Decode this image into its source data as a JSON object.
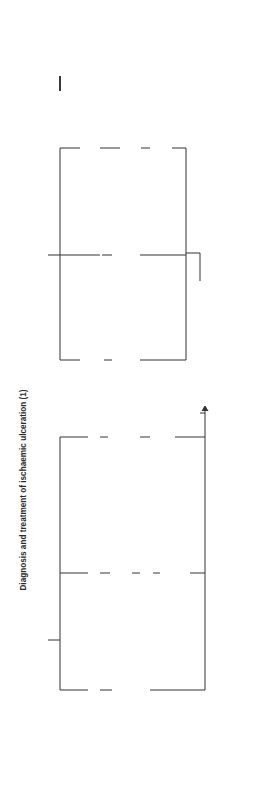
{
  "title": "Diagnosis and treatment of ischaemic ulceration (1)",
  "sections": {
    "history": {
      "label": "History",
      "branches": [
        {
          "head": "No symptoms",
          "items": [
            "May be\nmild ischaemia\ncomplicating\nvenous ulcer"
          ]
        },
        {
          "head": "Intermittent\nclaudication",
          "items": [
            "?Ischaemic",
            "?Venous claudication",
            "?Swollen leg/\ngroin collaterals"
          ]
        },
        {
          "head": "Rest\npain",
          "items": [
            "Venous ulcers\ncan be\npainful",
            "?Gout\n?Arthritis"
          ]
        }
      ]
    },
    "ulcer_site": {
      "label": "Ulcer site",
      "branches": [
        {
          "head": "Dorsal foot/\nanterior leg",
          "items": [
            "Probably\nischaemic"
          ]
        },
        {
          "head": "Supramalleolar\nskin",
          "items": [
            "?Venous but\nmay be ischaemic"
          ]
        },
        {
          "head": "Sole of\nfoot",
          "items": [
            "?Diabetes",
            "Test\nurine"
          ]
        }
      ]
    },
    "leg_foot": {
      "label": "Leg/foot appearance",
      "branches": [
        {
          "head": "Warm, pink",
          "items": []
        },
        {
          "head": "Pale cyanosis\nVenous guttering",
          "items": []
        },
        {
          "head": "Pregangrene\nGangrene",
          "items": [
            "Ischaemic"
          ]
        },
        {
          "head": "Varicose veins/\nankle flare",
          "items": [
            "?Mixed\narteriovenous\nulcer"
          ]
        }
      ]
    }
  },
  "outcome": {
    "label": "Check ankle pulses",
    "next": "Flow chart\npage 161"
  }
}
